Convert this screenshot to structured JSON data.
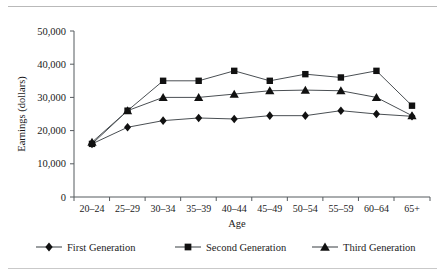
{
  "figure": {
    "has_top_rule": true,
    "has_bottom_rule": true
  },
  "chart_data": {
    "type": "line",
    "title": "",
    "xlabel": "Age",
    "ylabel": "Earnings (dollars)",
    "categories": [
      "20–24",
      "25–29",
      "30–34",
      "35–39",
      "40–44",
      "45–49",
      "50–54",
      "55–59",
      "60–64",
      "65+"
    ],
    "ylim": [
      0,
      50000
    ],
    "yticks": [
      0,
      10000,
      20000,
      30000,
      40000,
      50000
    ],
    "ytick_labels": [
      "0",
      "10,000",
      "20,000",
      "30,000",
      "40,000",
      "50,000"
    ],
    "grid": false,
    "legend_position": "bottom",
    "series": [
      {
        "name": "First Generation",
        "marker": "diamond",
        "color": "#111111",
        "values": [
          16000,
          21000,
          23000,
          23800,
          23500,
          24500,
          24500,
          26000,
          25000,
          24300
        ]
      },
      {
        "name": "Second Generation",
        "marker": "square",
        "color": "#111111",
        "values": [
          16000,
          26000,
          35000,
          35000,
          38000,
          35000,
          37000,
          36000,
          38000,
          27500
        ]
      },
      {
        "name": "Third Generation",
        "marker": "triangle",
        "color": "#111111",
        "values": [
          16500,
          26000,
          30000,
          30000,
          31000,
          32000,
          32200,
          32000,
          30000,
          24500
        ]
      }
    ]
  }
}
